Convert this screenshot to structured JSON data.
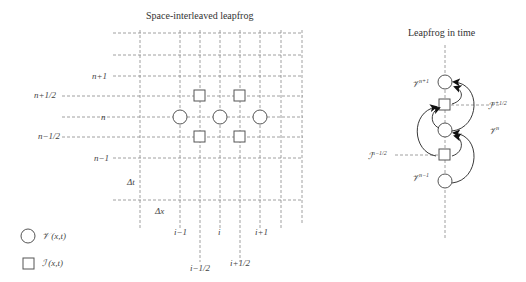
{
  "left_panel": {
    "title": "Space-interleaved leapfrog",
    "row_labels": [
      "n+1",
      "n+1/2",
      "n",
      "n−1/2",
      "n−1"
    ],
    "delta_t": "Δt",
    "delta_x": "Δx",
    "col_labels": [
      "i−1",
      "i",
      "i+1"
    ],
    "col_half_labels": [
      "i−1/2",
      "i+1/2"
    ],
    "legend": [
      {
        "shape": "circle",
        "label": "𝒱 (x,t)"
      },
      {
        "shape": "square",
        "label": "ℐ (x,t)"
      }
    ]
  },
  "right_panel": {
    "title": "Leapfrog in time",
    "labels": {
      "v_np1": "𝒱",
      "v_np1_sup": "n+1",
      "i_nph": "ℐ",
      "i_nph_sup": "n+1/2",
      "v_n": "𝒱",
      "v_n_sup": "n",
      "i_nmh": "ℐ",
      "i_nmh_sup": "n−1/2",
      "v_nm1": "𝒱",
      "v_nm1_sup": "n−1"
    }
  },
  "colors": {
    "line": "#777777",
    "shape_stroke": "#555555",
    "arrow": "#222222"
  }
}
